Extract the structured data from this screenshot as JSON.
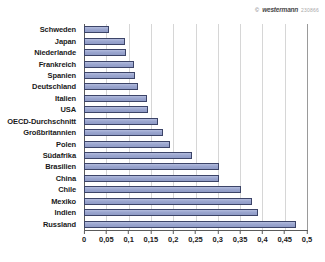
{
  "watermark": {
    "copyright_symbol": "©",
    "publisher": "westermann",
    "code": "230866"
  },
  "chart_data": {
    "type": "bar",
    "orientation": "horizontal",
    "title": "",
    "subtitle": "",
    "xlabel": "",
    "ylabel": "",
    "xlim": [
      0,
      0.5
    ],
    "grid": true,
    "legend": false,
    "decimal_separator": ",",
    "xticks": [
      "0",
      "0,05",
      "0,1",
      "0,15",
      "0,2",
      "0,25",
      "0,3",
      "0,35",
      "0,4",
      "0,45",
      "0,5"
    ],
    "xtick_values": [
      0,
      0.05,
      0.1,
      0.15,
      0.2,
      0.25,
      0.3,
      0.35,
      0.4,
      0.45,
      0.5
    ],
    "categories": [
      "Schweden",
      "Japan",
      "Niederlande",
      "Frankreich",
      "Spanien",
      "Deutschland",
      "Italien",
      "USA",
      "OECD-Durchschnitt",
      "Großbritannien",
      "Polen",
      "Südafrika",
      "Brasilien",
      "China",
      "Chile",
      "Mexiko",
      "Indien",
      "Russland"
    ],
    "values": [
      0.057,
      0.093,
      0.095,
      0.113,
      0.115,
      0.122,
      0.142,
      0.143,
      0.166,
      0.177,
      0.193,
      0.242,
      0.303,
      0.303,
      0.351,
      0.377,
      0.39,
      0.475
    ],
    "bar_color": "#9ba6cf",
    "bar_border_color": "#3c4468",
    "grid_color": "#d6d6d6",
    "axis_color": "#5a5a5a"
  }
}
